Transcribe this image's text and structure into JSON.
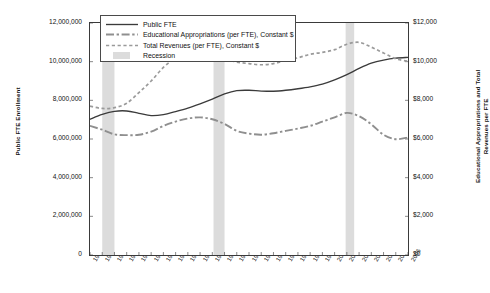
{
  "chart_data": {
    "type": "line",
    "title": "",
    "xlabel": "",
    "ylabel": "Public FTE Enrollment",
    "y2label": "Educational Appropriations and Total Revenues per FTE",
    "grid": false,
    "legend_position": "top-left",
    "ylim": [
      0,
      12000000
    ],
    "y2lim": [
      0,
      12000
    ],
    "x": [
      1980,
      1981,
      1982,
      1983,
      1984,
      1985,
      1986,
      1987,
      1988,
      1989,
      1990,
      1991,
      1992,
      1993,
      1994,
      1995,
      1996,
      1997,
      1998,
      1999,
      2000,
      2001,
      2002,
      2003,
      2004,
      2005,
      2006
    ],
    "xticklabels": [
      "1980",
      "1981",
      "1982",
      "1983",
      "1984",
      "1985",
      "1986",
      "1987",
      "1988",
      "1989",
      "1990",
      "1991",
      "1992",
      "1993",
      "1994",
      "1995",
      "1996",
      "1997",
      "1998",
      "1999",
      "2000",
      "2001",
      "2002",
      "2003",
      "2004",
      "2005",
      "2006"
    ],
    "yticklabels": [
      "0",
      "2,000,000",
      "4,000,000",
      "6,000,000",
      "8,000,000",
      "10,000,000",
      "12,000,000"
    ],
    "yticks": [
      0,
      2000000,
      4000000,
      6000000,
      8000000,
      10000000,
      12000000
    ],
    "y2ticklabels": [
      "$0",
      "$2,000",
      "$4,000",
      "$6,000",
      "$8,000",
      "$10,000",
      "$12,000"
    ],
    "y2ticks": [
      0,
      2000,
      4000,
      6000,
      8000,
      10000,
      12000
    ],
    "series": [
      {
        "name": "Public FTE",
        "axis": "left",
        "style": "solid",
        "color": "#3b3b3b",
        "values": [
          7020000,
          7270000,
          7430000,
          7450000,
          7330000,
          7210000,
          7260000,
          7420000,
          7600000,
          7820000,
          8060000,
          8330000,
          8500000,
          8520000,
          8480000,
          8470000,
          8520000,
          8600000,
          8700000,
          8840000,
          9060000,
          9330000,
          9650000,
          9920000,
          10080000,
          10180000,
          10220000
        ]
      },
      {
        "name": "Total Revenues (per FTE), Constant $",
        "axis": "right",
        "style": "dotted",
        "color": "#9a9a9a",
        "values": [
          7700,
          7580,
          7620,
          7850,
          8400,
          9000,
          9700,
          10180,
          10420,
          10480,
          10420,
          10160,
          9980,
          9900,
          9840,
          9900,
          10060,
          10200,
          10380,
          10480,
          10620,
          10900,
          11000,
          10750,
          10450,
          10150,
          10020
        ]
      },
      {
        "name": "Educational Appropriations (per FTE), Constant $",
        "axis": "right",
        "style": "dashdot",
        "color": "#8f8f8f",
        "values": [
          6680,
          6480,
          6240,
          6200,
          6220,
          6380,
          6680,
          6900,
          7060,
          7120,
          7020,
          6780,
          6420,
          6280,
          6220,
          6300,
          6420,
          6540,
          6680,
          6900,
          7120,
          7350,
          7180,
          6760,
          6220,
          5990,
          6080
        ]
      }
    ],
    "recessions": [
      {
        "label": "Recession",
        "start": 1981.0,
        "end": 1982.0
      },
      {
        "label": "Recession",
        "start": 1990.1,
        "end": 1991.0
      },
      {
        "label": "Recession",
        "start": 2000.9,
        "end": 2001.6
      }
    ],
    "recession_color": "#dcdcdc",
    "legend": [
      {
        "label": "Public FTE",
        "style": "solid"
      },
      {
        "label": "Educational Appropriations (per FTE), Constant $",
        "style": "dashdot"
      },
      {
        "label": "Total Revenues (per FTE), Constant $",
        "style": "dotted"
      },
      {
        "label": "Recession",
        "style": "swatch"
      }
    ]
  }
}
